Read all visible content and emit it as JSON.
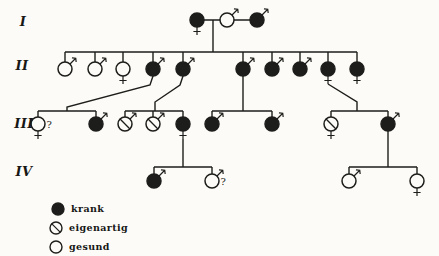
{
  "colors": {
    "ink": "#1d1d1b",
    "paper": "#fcfbf8"
  },
  "generation_labels": [
    {
      "label": "I",
      "x": 23,
      "y": 21
    },
    {
      "label": "II",
      "x": 22,
      "y": 65
    },
    {
      "label": "III",
      "x": 24,
      "y": 123
    },
    {
      "label": "IV",
      "x": 24,
      "y": 171
    }
  ],
  "legend": {
    "items": [
      {
        "label": "krank",
        "status": "affected",
        "x": 58,
        "y": 209
      },
      {
        "label": "eigenartig",
        "status": "peculiar",
        "x": 56,
        "y": 228
      },
      {
        "label": "gesund",
        "status": "healthy",
        "x": 56,
        "y": 247
      }
    ]
  },
  "pedigree": {
    "symbol_radius": 7,
    "uncertain_glyph": "?",
    "persons": [
      {
        "id": "I-1",
        "x": 197,
        "y": 20,
        "sex": "female",
        "status": "affected"
      },
      {
        "id": "I-2",
        "x": 227,
        "y": 20,
        "sex": "male",
        "status": "healthy"
      },
      {
        "id": "I-3",
        "x": 257,
        "y": 20,
        "sex": "male",
        "status": "affected"
      },
      {
        "id": "II-1",
        "x": 65,
        "y": 69,
        "sex": "male",
        "status": "healthy",
        "sib_y": 52
      },
      {
        "id": "II-2",
        "x": 95,
        "y": 69,
        "sex": "male",
        "status": "healthy",
        "sib_y": 52
      },
      {
        "id": "II-3",
        "x": 123,
        "y": 69,
        "sex": "female",
        "status": "healthy",
        "sib_y": 52
      },
      {
        "id": "II-4",
        "x": 153,
        "y": 69,
        "sex": "male",
        "status": "affected",
        "sib_y": 52
      },
      {
        "id": "II-5",
        "x": 183,
        "y": 69,
        "sex": "male",
        "status": "affected",
        "sib_y": 52
      },
      {
        "id": "II-6",
        "x": 243,
        "y": 69,
        "sex": "male",
        "status": "affected",
        "sib_y": 52
      },
      {
        "id": "II-7",
        "x": 272,
        "y": 69,
        "sex": "male",
        "status": "affected",
        "sib_y": 52
      },
      {
        "id": "II-8",
        "x": 300,
        "y": 69,
        "sex": "male",
        "status": "affected",
        "sib_y": 52
      },
      {
        "id": "II-9",
        "x": 328,
        "y": 69,
        "sex": "female",
        "status": "affected",
        "sib_y": 52
      },
      {
        "id": "II-10",
        "x": 357,
        "y": 69,
        "sex": "female",
        "status": "affected",
        "sib_y": 52
      },
      {
        "id": "III-1",
        "x": 38,
        "y": 124,
        "sex": "female",
        "status": "healthy",
        "sib_y": 111,
        "uncertain": true
      },
      {
        "id": "III-2",
        "x": 96,
        "y": 124,
        "sex": "male",
        "status": "affected",
        "sib_y": 111
      },
      {
        "id": "III-3",
        "x": 125,
        "y": 124,
        "sex": "male",
        "status": "peculiar",
        "sib_y": 111
      },
      {
        "id": "III-4",
        "x": 153,
        "y": 124,
        "sex": "male",
        "status": "peculiar",
        "sib_y": 111
      },
      {
        "id": "III-5",
        "x": 183,
        "y": 124,
        "sex": "female",
        "status": "affected",
        "sib_y": 111
      },
      {
        "id": "III-6",
        "x": 212,
        "y": 124,
        "sex": "male",
        "status": "affected",
        "sib_y": 111
      },
      {
        "id": "III-7",
        "x": 272,
        "y": 124,
        "sex": "male",
        "status": "affected",
        "sib_y": 111
      },
      {
        "id": "III-8",
        "x": 331,
        "y": 124,
        "sex": "female",
        "status": "peculiar",
        "sib_y": 111
      },
      {
        "id": "III-9",
        "x": 388,
        "y": 124,
        "sex": "male",
        "status": "affected",
        "sib_y": 111
      },
      {
        "id": "IV-1",
        "x": 154,
        "y": 181,
        "sex": "male",
        "status": "affected",
        "sib_y": 167
      },
      {
        "id": "IV-2",
        "x": 212,
        "y": 181,
        "sex": "male",
        "status": "healthy",
        "sib_y": 167,
        "uncertain": true
      },
      {
        "id": "IV-3",
        "x": 349,
        "y": 181,
        "sex": "male",
        "status": "healthy",
        "sib_y": 167
      },
      {
        "id": "IV-4",
        "x": 417,
        "y": 181,
        "sex": "female",
        "status": "healthy",
        "sib_y": 167
      }
    ],
    "lines": [
      {
        "name": "marriage-line-gen1",
        "points": [
          [
            197,
            20
          ],
          [
            257,
            20
          ]
        ]
      },
      {
        "name": "descent-line-gen1",
        "points": [
          [
            213,
            20
          ],
          [
            213,
            52
          ]
        ]
      },
      {
        "name": "sibship-line-gen2",
        "points": [
          [
            65,
            52
          ],
          [
            357,
            52
          ]
        ]
      },
      {
        "name": "descent-line-ii4",
        "points": [
          [
            153,
            76
          ],
          [
            150,
            85
          ],
          [
            67,
            107
          ],
          [
            67,
            111
          ]
        ]
      },
      {
        "name": "descent-line-ii5",
        "points": [
          [
            183,
            76
          ],
          [
            180,
            85
          ],
          [
            155,
            102
          ],
          [
            155,
            111
          ]
        ]
      },
      {
        "name": "descent-line-ii6",
        "points": [
          [
            243,
            76
          ],
          [
            243,
            111
          ]
        ]
      },
      {
        "name": "descent-line-ii9",
        "points": [
          [
            328,
            84
          ],
          [
            357,
            102
          ],
          [
            357,
            111
          ]
        ]
      },
      {
        "name": "sibship-line-gen3-fam1",
        "points": [
          [
            38,
            111
          ],
          [
            96,
            111
          ]
        ]
      },
      {
        "name": "sibship-line-gen3-fam2",
        "points": [
          [
            125,
            111
          ],
          [
            183,
            111
          ]
        ]
      },
      {
        "name": "sibship-line-gen3-fam3",
        "points": [
          [
            212,
            111
          ],
          [
            272,
            111
          ]
        ]
      },
      {
        "name": "sibship-line-gen3-fam4",
        "points": [
          [
            331,
            111
          ],
          [
            388,
            111
          ]
        ]
      },
      {
        "name": "descent-line-iii5",
        "points": [
          [
            183,
            139
          ],
          [
            183,
            167
          ]
        ]
      },
      {
        "name": "descent-line-iii9",
        "points": [
          [
            388,
            131
          ],
          [
            388,
            167
          ]
        ]
      },
      {
        "name": "sibship-line-gen4-fam1",
        "points": [
          [
            154,
            167
          ],
          [
            212,
            167
          ]
        ]
      },
      {
        "name": "sibship-line-gen4-fam2",
        "points": [
          [
            349,
            167
          ],
          [
            417,
            167
          ]
        ]
      }
    ]
  }
}
